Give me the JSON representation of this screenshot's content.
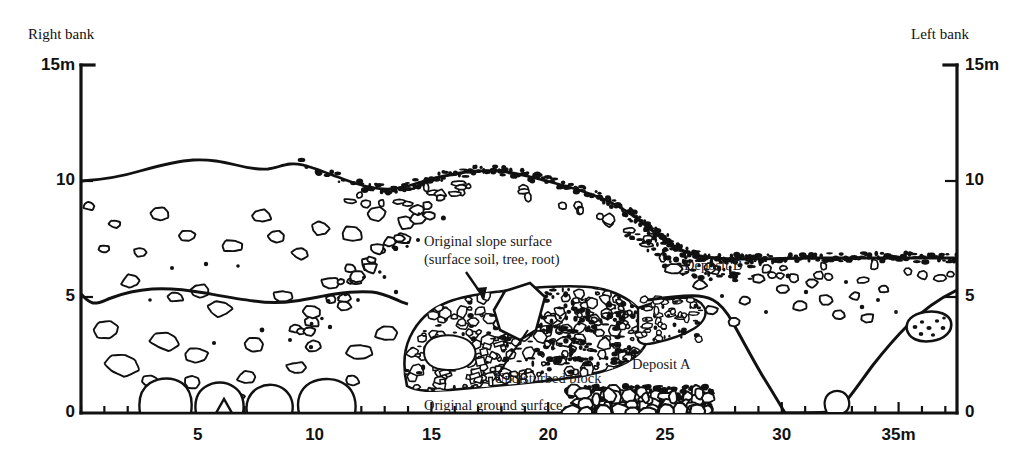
{
  "figure": {
    "bank_left_label": "Right bank",
    "bank_right_label": "Left bank",
    "ink_color": "#111111",
    "background_color": "#ffffff"
  },
  "axes": {
    "y_left_ticks": [
      "15m",
      "10",
      "5",
      "0"
    ],
    "y_right_ticks": [
      "15m",
      "10",
      "5",
      "0"
    ],
    "x_ticks": [
      "5",
      "10",
      "15",
      "20",
      "25",
      "30",
      "35m"
    ],
    "x_tick_values": [
      5,
      10,
      15,
      20,
      25,
      30,
      35
    ],
    "y_tick_values": [
      15,
      10,
      5,
      0
    ],
    "x_min": 0,
    "x_max": 37.5,
    "y_min": 0,
    "y_max": 15,
    "x_unit": "m",
    "y_unit": "m",
    "minor_tick_interval": 1
  },
  "annotations": {
    "original_slope_surface_line1": "Original slope surface",
    "original_slope_surface_line2": "(surface soil, tree, root)",
    "undisturbed_block": "Undisturbed block",
    "original_ground_surface": "Original ground surface",
    "deposit_a": "Deposit A",
    "deposit_b": "Deposit B"
  },
  "chart_data": {
    "type": "line",
    "xlabel": "Distance (m)",
    "ylabel": "Elevation (m)",
    "xlim": [
      0,
      37.5
    ],
    "ylim": [
      0,
      15
    ],
    "grid": false,
    "legend": null,
    "series": [
      {
        "name": "Original slope surface (surface soil, tree, root)",
        "comment": "upper ground profile from right bank to left bank",
        "points": [
          [
            0.0,
            10.0
          ],
          [
            1.0,
            10.05
          ],
          [
            2.0,
            10.2
          ],
          [
            3.0,
            10.45
          ],
          [
            4.0,
            10.6
          ],
          [
            5.0,
            10.65
          ],
          [
            6.0,
            10.6
          ],
          [
            7.0,
            10.45
          ],
          [
            7.6,
            10.4
          ],
          [
            8.2,
            10.55
          ],
          [
            9.0,
            10.5
          ],
          [
            10.0,
            10.3
          ],
          [
            11.0,
            10.05
          ],
          [
            12.0,
            9.85
          ],
          [
            13.0,
            9.7
          ],
          [
            14.0,
            9.62
          ],
          [
            15.0,
            9.7
          ],
          [
            16.0,
            9.9
          ],
          [
            17.0,
            10.05
          ],
          [
            18.0,
            10.2
          ],
          [
            19.0,
            10.25
          ],
          [
            20.0,
            10.25
          ],
          [
            21.0,
            10.15
          ],
          [
            22.0,
            10.0
          ],
          [
            23.0,
            9.85
          ],
          [
            24.0,
            9.7
          ],
          [
            25.0,
            9.5
          ],
          [
            26.0,
            9.2
          ],
          [
            27.0,
            8.7
          ],
          [
            28.0,
            8.1
          ],
          [
            29.0,
            7.7
          ],
          [
            30.0,
            7.5
          ],
          [
            31.0,
            7.42
          ],
          [
            32.0,
            7.4
          ],
          [
            33.0,
            7.4
          ],
          [
            34.0,
            7.42
          ],
          [
            35.0,
            7.45
          ],
          [
            36.0,
            7.45
          ],
          [
            37.5,
            7.45
          ]
        ]
      },
      {
        "name": "Original ground surface / Deposit A upper boundary",
        "comment": "boundary separating Deposit A from Deposit B",
        "points": [
          [
            0.0,
            5.1
          ],
          [
            0.6,
            4.9
          ],
          [
            1.2,
            5.05
          ],
          [
            2.0,
            4.6
          ],
          [
            4.0,
            4.35
          ],
          [
            6.0,
            4.2
          ],
          [
            8.0,
            4.3
          ],
          [
            10.0,
            4.4
          ],
          [
            11.5,
            4.55
          ],
          [
            12.5,
            4.75
          ],
          [
            13.5,
            5.0
          ],
          [
            14.3,
            5.0
          ],
          [
            15.0,
            5.2
          ],
          [
            16.0,
            5.3
          ],
          [
            17.0,
            5.35
          ],
          [
            18.0,
            5.4
          ],
          [
            19.0,
            5.5
          ],
          [
            20.0,
            5.45
          ],
          [
            21.0,
            5.4
          ],
          [
            22.0,
            5.3
          ],
          [
            23.0,
            5.25
          ],
          [
            24.0,
            5.2
          ],
          [
            25.0,
            5.1
          ],
          [
            25.6,
            4.9
          ],
          [
            26.3,
            4.3
          ],
          [
            27.0,
            3.2
          ],
          [
            27.8,
            1.8
          ],
          [
            28.5,
            0.6
          ],
          [
            29.0,
            0.05
          ],
          [
            31.8,
            0.0
          ],
          [
            32.6,
            0.9
          ],
          [
            33.6,
            2.0
          ],
          [
            34.4,
            2.65
          ],
          [
            35.4,
            3.1
          ],
          [
            36.4,
            3.6
          ],
          [
            37.5,
            4.1
          ]
        ]
      }
    ],
    "regions": [
      {
        "name": "Deposit B",
        "label": "Deposit B",
        "label_at": [
          25.0,
          6.6
        ],
        "fill": "sparse rock outlines",
        "description": "Upper unit between original slope surface and Deposit A"
      },
      {
        "name": "Deposit A",
        "label": "Deposit A",
        "label_at": [
          24.2,
          2.6
        ],
        "fill": "dense gravel stipple",
        "description": "Lower coarse deposit mass between 14m and 27m"
      },
      {
        "name": "Undisturbed block",
        "label": "Undisturbed block",
        "label_at": [
          19.0,
          1.9
        ],
        "description": "Intact block embedded within Deposit A"
      }
    ]
  }
}
